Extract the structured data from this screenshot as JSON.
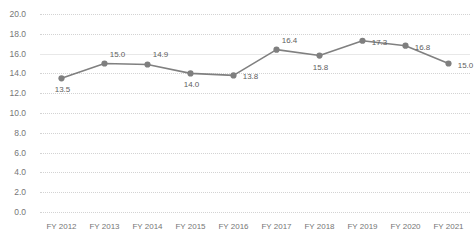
{
  "chart_data": {
    "type": "line",
    "title": "",
    "subtitle": "",
    "xlabel": "",
    "ylabel": "",
    "categories": [
      "FY 2012",
      "FY 2013",
      "FY 2014",
      "FY 2015",
      "FY 2016",
      "FY 2017",
      "FY 2018",
      "FY 2019",
      "FY 2020",
      "FY 2021"
    ],
    "values": [
      13.5,
      15.0,
      14.9,
      14.0,
      13.8,
      16.4,
      15.8,
      17.3,
      16.8,
      15.0
    ],
    "point_labels": [
      "13.5",
      "15.0",
      "14.9",
      "14.0",
      "13.8",
      "16.4",
      "15.8",
      "17.3",
      "16.8",
      "15.0"
    ],
    "label_positions": [
      "below",
      "above",
      "above",
      "below",
      "right",
      "above",
      "below",
      "right",
      "right",
      "right"
    ],
    "ylim": [
      0.0,
      20.0
    ],
    "ytick_step": 2.0,
    "ytick_labels": [
      "20.0",
      "18.0",
      "16.0",
      "14.0",
      "12.0",
      "10.0",
      "8.0",
      "6.0",
      "4.0",
      "2.0",
      "0.0"
    ],
    "ytick_values": [
      20.0,
      18.0,
      16.0,
      14.0,
      12.0,
      10.0,
      8.0,
      6.0,
      4.0,
      2.0,
      0.0
    ],
    "grid": true,
    "grid_style": "dotted",
    "legend": false,
    "legend_position": "none",
    "series": [
      {
        "name": "Value",
        "values": [
          13.5,
          15.0,
          14.9,
          14.0,
          13.8,
          16.4,
          15.8,
          17.3,
          16.8,
          15.0
        ]
      }
    ]
  },
  "style": {
    "line_color": "#808080",
    "marker_color": "#7f7f7f",
    "grid_color": "#d3d3d3",
    "axis_text_color": "#767676",
    "label_text_color": "#5e5e5e",
    "background": "#ffffff"
  }
}
